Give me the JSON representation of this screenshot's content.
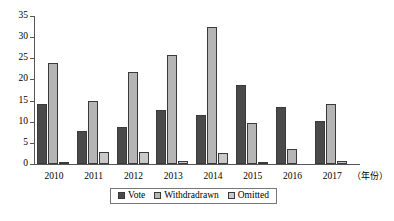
{
  "chart_data": {
    "type": "bar",
    "title": "",
    "subtitle": "",
    "xlabel": "（年份）",
    "ylabel": "",
    "categories": [
      "2010",
      "2011",
      "2012",
      "2013",
      "2014",
      "2015",
      "2016",
      "2017"
    ],
    "series": [
      {
        "name": "Vote",
        "color": "#4a4a4a",
        "values": [
          14.1,
          7.9,
          8.7,
          12.8,
          11.5,
          18.6,
          13.6,
          10.2
        ]
      },
      {
        "name": "Withdradrawn",
        "color": "#b5b5b5",
        "values": [
          23.9,
          14.9,
          21.8,
          25.8,
          32.5,
          9.7,
          3.6,
          14.3
        ]
      },
      {
        "name": "Omitted",
        "color": "#c9c9c9",
        "values": [
          0.2,
          2.9,
          2.9,
          0.6,
          2.7,
          0.2,
          0.0,
          0.7
        ]
      }
    ],
    "ylim": [
      0,
      35
    ],
    "yticks": [
      0,
      5,
      10,
      15,
      20,
      25,
      30,
      35
    ],
    "ytick_labels": [
      "0",
      "5",
      "10",
      "15",
      "20",
      "25",
      "30",
      "35"
    ],
    "grid": false,
    "legend_position": "bottom-center",
    "legend_entries": [
      "Vote",
      "Withdradrawn",
      "Omitted"
    ]
  }
}
